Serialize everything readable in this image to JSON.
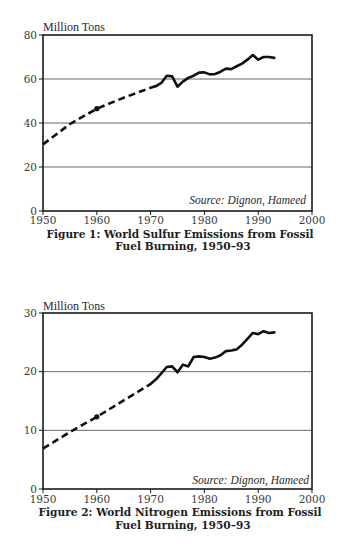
{
  "chart_data": [
    {
      "type": "line",
      "title": "Figure 1: World Sulfur Emissions from Fossil Fuel Burning, 1950–93",
      "caption_lines": [
        "Figure 1: World Sulfur Emissions from Fossil",
        "Fuel Burning, 1950–93"
      ],
      "ylabel": "Million Tons",
      "xlabel": "",
      "source": "Source: Dignon, Hameed",
      "xlim": [
        1950,
        2000
      ],
      "ylim": [
        0,
        80
      ],
      "xticks": [
        1950,
        1960,
        1970,
        1980,
        1990,
        2000
      ],
      "xtick_labels": [
        "1950",
        "1960",
        "1970",
        "1980",
        "1990",
        "2000"
      ],
      "yticks": [
        0,
        20,
        40,
        60,
        80
      ],
      "ytick_labels": [
        "0",
        "20",
        "40",
        "60",
        "80"
      ],
      "grid": "horizontal",
      "legend": "none",
      "series": [
        {
          "name": "Estimated (dashed)",
          "style": "dashed",
          "x": [
            1950,
            1955,
            1960,
            1965,
            1970,
            1971
          ],
          "values": [
            30.3,
            39.5,
            46.5,
            51.5,
            56,
            56.8
          ]
        },
        {
          "name": "Observed (solid)",
          "style": "solid",
          "x": [
            1971,
            1972,
            1973,
            1974,
            1975,
            1976,
            1977,
            1978,
            1979,
            1980,
            1981,
            1982,
            1983,
            1984,
            1985,
            1986,
            1987,
            1988,
            1989,
            1990,
            1991,
            1992,
            1993
          ],
          "values": [
            56.8,
            58.2,
            61.5,
            61.2,
            56.5,
            58.8,
            60.5,
            61.5,
            62.9,
            63,
            62.1,
            62.3,
            63.3,
            64.7,
            64.5,
            65.8,
            67,
            68.8,
            70.9,
            68.8,
            70,
            70,
            69.6
          ]
        }
      ],
      "markers": [
        {
          "x": 1960,
          "value": 46.5
        }
      ]
    },
    {
      "type": "line",
      "title": "Figure 2: World Nitrogen Emissions from Fossil Fuel Burning, 1950–93",
      "caption_lines": [
        "Figure 2: World Nitrogen Emissions from Fossil",
        "Fuel Burning, 1950–93"
      ],
      "ylabel": "Million Tons",
      "xlabel": "",
      "source": "Source: Dignon, Hameed",
      "xlim": [
        1950,
        2000
      ],
      "ylim": [
        0,
        30
      ],
      "xticks": [
        1950,
        1960,
        1970,
        1980,
        1990,
        2000
      ],
      "xtick_labels": [
        "1950",
        "1960",
        "1970",
        "1980",
        "1990",
        "2000"
      ],
      "yticks": [
        0,
        10,
        20,
        30
      ],
      "ytick_labels": [
        "0",
        "10",
        "20",
        "30"
      ],
      "grid": "horizontal",
      "legend": "none",
      "series": [
        {
          "name": "Estimated (dashed)",
          "style": "dashed",
          "x": [
            1950,
            1955,
            1960,
            1965,
            1970
          ],
          "values": [
            6.9,
            9.7,
            12.3,
            15.1,
            17.9
          ]
        },
        {
          "name": "Observed (solid)",
          "style": "solid",
          "x": [
            1970,
            1971,
            1972,
            1973,
            1974,
            1975,
            1976,
            1977,
            1978,
            1979,
            1980,
            1981,
            1982,
            1983,
            1984,
            1985,
            1986,
            1987,
            1988,
            1989,
            1990,
            1991,
            1992,
            1993
          ],
          "values": [
            17.9,
            18.7,
            19.7,
            20.8,
            20.9,
            19.9,
            21.2,
            20.9,
            22.5,
            22.6,
            22.5,
            22.2,
            22.4,
            22.8,
            23.5,
            23.6,
            23.8,
            24.6,
            25.6,
            26.6,
            26.4,
            26.9,
            26.6,
            26.7
          ]
        }
      ],
      "markers": [
        {
          "x": 1960,
          "value": 12.3
        }
      ]
    }
  ]
}
